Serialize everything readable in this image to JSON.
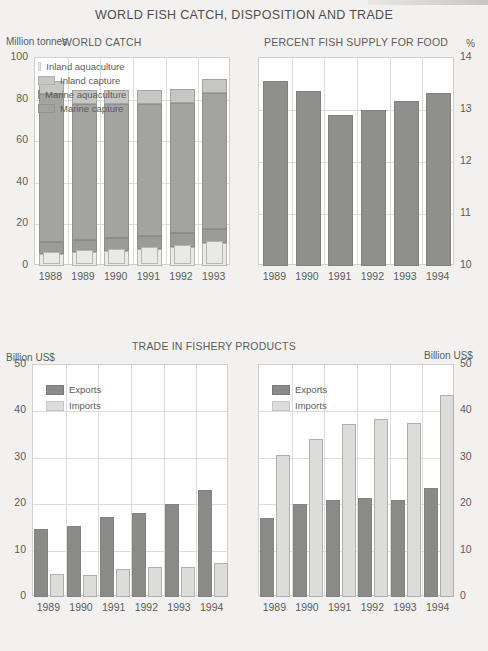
{
  "main_title": "WORLD FISH CATCH, DISPOSITION AND TRADE",
  "colors": {
    "inland_aquaculture": "#e9e9e7",
    "marine_aquaculture": "#9b9b99",
    "inland_capture": "#c6c6c4",
    "marine_capture": "#a3a3a1",
    "exports": "#8a8a88",
    "imports": "#dcdcda",
    "percent_bar": "#8f8f8d",
    "plot_bg": "#ffffff",
    "page_bg": "#f2f1ef",
    "grid": "#dcdcdc",
    "text": "#5a5a5a"
  },
  "chart_data": [
    {
      "id": "world_catch",
      "type": "bar",
      "stacked": true,
      "title": "WORLD CATCH",
      "ylabel": "Million tonnes",
      "xlabel": "",
      "ylim": [
        0,
        100
      ],
      "yticks": [
        0,
        20,
        40,
        60,
        80,
        100
      ],
      "grid": true,
      "legend_position": "top-inside",
      "categories": [
        "1988",
        "1989",
        "1990",
        "1991",
        "1992",
        "1993"
      ],
      "series": [
        {
          "name": "Inland aquaculture",
          "key": "inland_aquaculture",
          "values": [
            6.0,
            6.8,
            7.2,
            8.0,
            9.3,
            11.2
          ]
        },
        {
          "name": "Marine aquaculture",
          "key": "marine_aquaculture",
          "values": [
            5.6,
            5.9,
            6.3,
            6.4,
            6.6,
            6.8
          ]
        },
        {
          "name": "Inland capture",
          "key": "inland_capture",
          "values": [
            6.3,
            6.3,
            6.4,
            6.5,
            6.6,
            6.8
          ]
        },
        {
          "name": "Marine capture",
          "key": "marine_capture",
          "values": [
            71.1,
            65.4,
            64.6,
            63.6,
            62.5,
            65.2
          ]
        }
      ],
      "totals": [
        89.0,
        84.4,
        84.5,
        84.5,
        85.0,
        90.0
      ]
    },
    {
      "id": "percent_fish_supply",
      "type": "bar",
      "stacked": false,
      "title": "PERCENT FISH SUPPLY FOR FOOD",
      "ylabel": "%",
      "xlabel": "",
      "ylim": [
        10,
        14
      ],
      "yticks": [
        10,
        11,
        12,
        13,
        14
      ],
      "grid": true,
      "categories": [
        "1989",
        "1990",
        "1991",
        "1992",
        "1993",
        "1994"
      ],
      "values": [
        13.55,
        13.37,
        12.9,
        13.0,
        13.18,
        13.32
      ]
    },
    {
      "id": "trade_developing",
      "type": "bar",
      "stacked": false,
      "group_title": "TRADE IN FISHERY PRODUCTS",
      "title": "DEVELOPING COUNTRIES",
      "ylabel": "Billion US$",
      "xlabel": "",
      "ylim": [
        0,
        50
      ],
      "yticks": [
        0,
        10,
        20,
        30,
        40,
        50
      ],
      "grid": true,
      "categories": [
        "1989",
        "1990",
        "1991",
        "1992",
        "1993",
        "1994"
      ],
      "series": [
        {
          "name": "Exports",
          "key": "exports",
          "values": [
            14.6,
            15.2,
            17.3,
            18.2,
            20.0,
            23.0
          ]
        },
        {
          "name": "Imports",
          "key": "imports",
          "values": [
            4.9,
            4.8,
            6.0,
            6.5,
            6.4,
            7.4
          ]
        }
      ]
    },
    {
      "id": "trade_developed",
      "type": "bar",
      "stacked": false,
      "title": "DEVELOPED COUNTRIES",
      "ylabel": "Billion US$",
      "xlabel": "",
      "ylim": [
        0,
        50
      ],
      "yticks": [
        0,
        10,
        20,
        30,
        40,
        50
      ],
      "grid": true,
      "categories": [
        "1989",
        "1990",
        "1991",
        "1992",
        "1993",
        "1994"
      ],
      "series": [
        {
          "name": "Exports",
          "key": "exports",
          "values": [
            17.0,
            20.0,
            21.0,
            21.3,
            20.8,
            23.5
          ]
        },
        {
          "name": "Imports",
          "key": "imports",
          "values": [
            30.5,
            34.0,
            37.2,
            38.4,
            37.4,
            43.6
          ]
        }
      ]
    }
  ]
}
